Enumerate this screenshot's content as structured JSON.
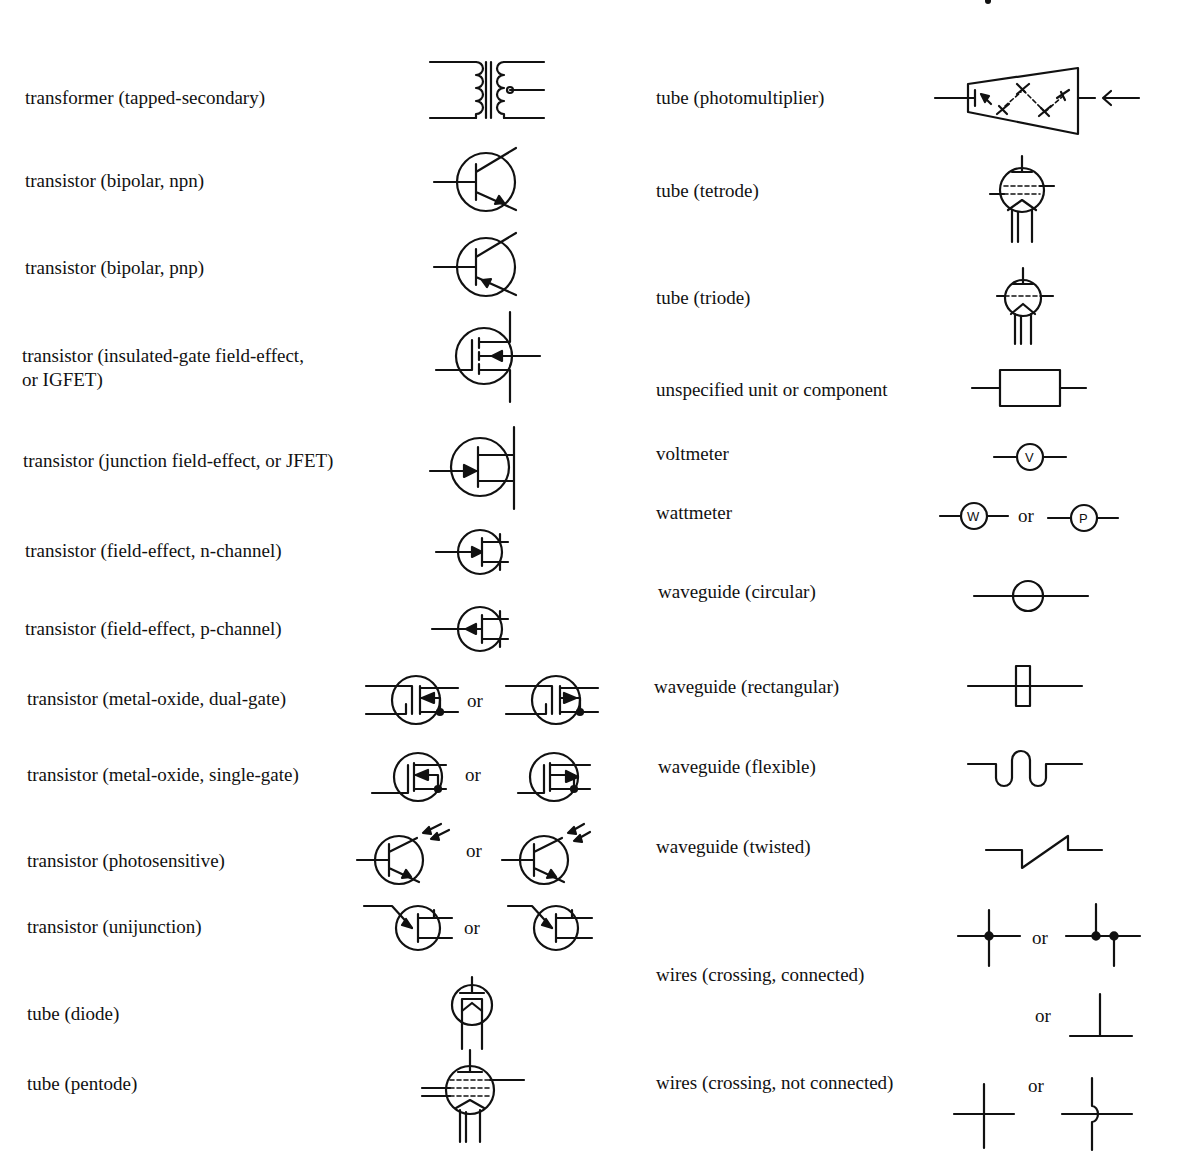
{
  "left_column": [
    {
      "label": "transformer (tapped-secondary)"
    },
    {
      "label": "transistor (bipolar, npn)"
    },
    {
      "label": "transistor (bipolar, pnp)"
    },
    {
      "label": "transistor (insulated-gate field-effect,",
      "label2": "or IGFET)"
    },
    {
      "label": "transistor (junction field-effect, or JFET)"
    },
    {
      "label": "transistor (field-effect, n-channel)"
    },
    {
      "label": "transistor (field-effect, p-channel)"
    },
    {
      "label": "transistor (metal-oxide, dual-gate)",
      "or": "or"
    },
    {
      "label": "transistor (metal-oxide, single-gate)",
      "or": "or"
    },
    {
      "label": "transistor (photosensitive)",
      "or": "or"
    },
    {
      "label": "transistor (unijunction)",
      "or": "or"
    },
    {
      "label": "tube (diode)"
    },
    {
      "label": "tube (pentode)"
    }
  ],
  "right_column": [
    {
      "label": "tube (photomultiplier)"
    },
    {
      "label": "tube (tetrode)"
    },
    {
      "label": "tube (triode)"
    },
    {
      "label": "unspecified unit or component"
    },
    {
      "label": "voltmeter",
      "symbol_text": "V"
    },
    {
      "label": "wattmeter",
      "symbol_text": "W",
      "symbol_text2": "P",
      "or": "or"
    },
    {
      "label": "waveguide (circular)"
    },
    {
      "label": "waveguide (rectangular)"
    },
    {
      "label": "waveguide (flexible)"
    },
    {
      "label": "waveguide (twisted)"
    },
    {
      "label": "wires (crossing, connected)",
      "or": "or",
      "or2": "or"
    },
    {
      "label": "wires (crossing, not connected)",
      "or": "or"
    }
  ]
}
